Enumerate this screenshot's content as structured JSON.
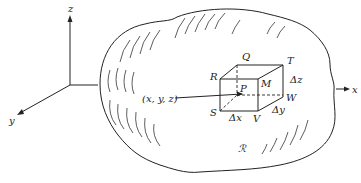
{
  "diagram": {
    "axes": {
      "z": "z",
      "y": "y",
      "x": "x"
    },
    "region_label": "ℛ",
    "point_label": "(x, y, z)",
    "box_vertices": {
      "Q": "Q",
      "T": "T",
      "R": "R",
      "M": "M",
      "P": "P",
      "W": "W",
      "S": "S",
      "V": "V"
    },
    "increments": {
      "dx": "Δx",
      "dy": "Δy",
      "dz": "Δz"
    }
  }
}
